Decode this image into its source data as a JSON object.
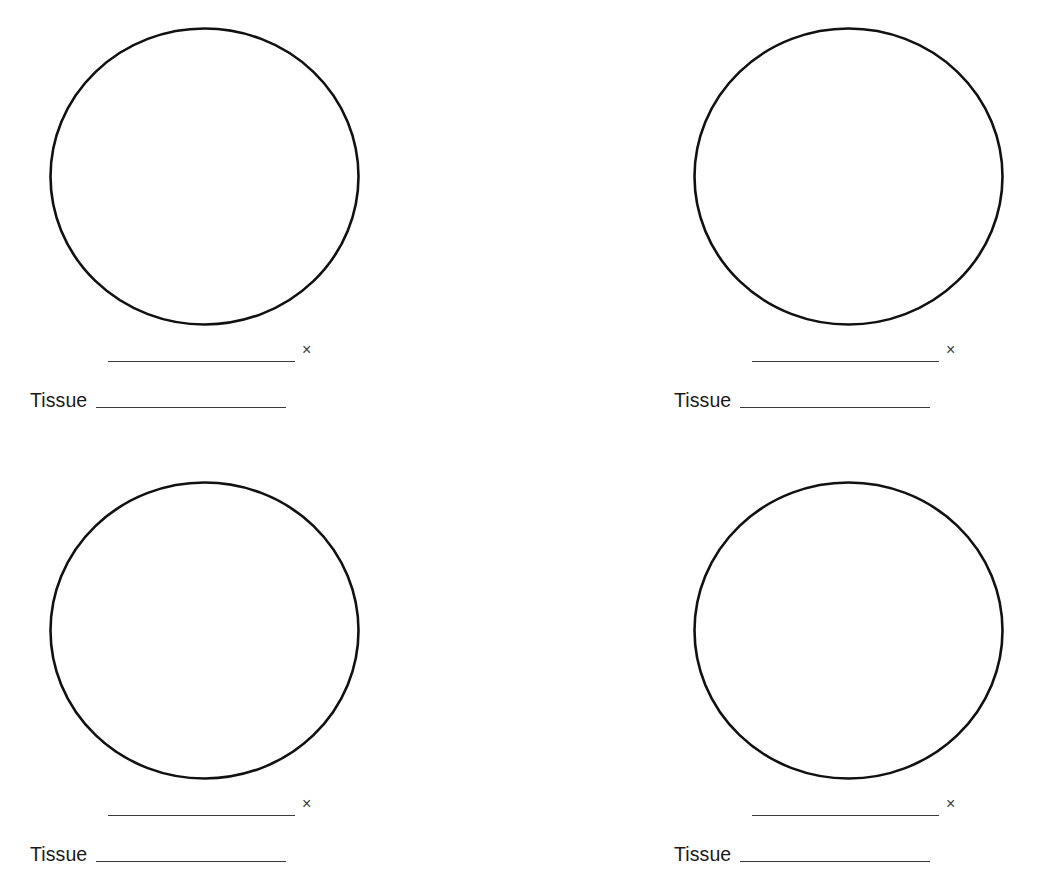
{
  "page": {
    "background_color": "#ffffff",
    "ink_color": "#111111",
    "line_color": "#3a3a3a",
    "text_color": "#1a1a1a"
  },
  "worksheet": {
    "title": "Microscope Observation Worksheet",
    "panel_count": 4,
    "panels": [
      {
        "id": "panel-1",
        "position": "top-left",
        "drawing_area": {
          "shape": "circle",
          "label": "microscope field of view",
          "content": "",
          "filled": false
        },
        "magnification": {
          "value": "",
          "placeholder": "",
          "unit_symbol": "×"
        },
        "tissue": {
          "label": "Tissue",
          "value": "",
          "placeholder": ""
        }
      },
      {
        "id": "panel-2",
        "position": "top-right",
        "drawing_area": {
          "shape": "circle",
          "label": "microscope field of view",
          "content": "",
          "filled": false
        },
        "magnification": {
          "value": "",
          "placeholder": "",
          "unit_symbol": "×"
        },
        "tissue": {
          "label": "Tissue",
          "value": "",
          "placeholder": ""
        }
      },
      {
        "id": "panel-3",
        "position": "bottom-left",
        "drawing_area": {
          "shape": "circle",
          "label": "microscope field of view",
          "content": "",
          "filled": false
        },
        "magnification": {
          "value": "",
          "placeholder": "",
          "unit_symbol": "×"
        },
        "tissue": {
          "label": "Tissue",
          "value": "",
          "placeholder": ""
        }
      },
      {
        "id": "panel-4",
        "position": "bottom-right",
        "drawing_area": {
          "shape": "circle",
          "label": "microscope field of view",
          "content": "",
          "filled": false
        },
        "magnification": {
          "value": "",
          "placeholder": "",
          "unit_symbol": "×"
        },
        "tissue": {
          "label": "Tissue",
          "value": "",
          "placeholder": ""
        }
      }
    ]
  }
}
